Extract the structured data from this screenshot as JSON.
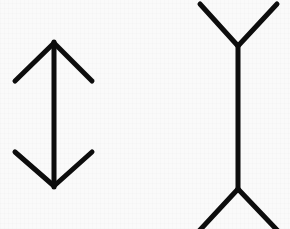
{
  "image": {
    "title": "Müller-Lyer illusion",
    "description": "Two vertical line segments of equal length; the left is capped with inward-pointing arrowheads, the right with outward-pointing fins.",
    "width": 290,
    "height": 229,
    "background_color": "#fafafa",
    "stroke_color": "#0d0d0d",
    "stroke_width": 5,
    "line_cap": "round",
    "figure_count": 2
  },
  "figures": [
    {
      "id": "left",
      "name": "arrow-in-figure",
      "label": "Inward arrowheads",
      "arrow_direction": "inward",
      "appears_as": "shorter",
      "shaft": {
        "x": 54,
        "y_top": 42,
        "y_bottom": 187,
        "length": 145
      },
      "top_cap": {
        "type": "arrowhead",
        "apex_x": 54,
        "apex_y": 42,
        "left_tip_x": 15,
        "left_tip_y": 81,
        "right_tip_x": 92,
        "right_tip_y": 81,
        "points": "down-out"
      },
      "bottom_cap": {
        "type": "arrowhead",
        "apex_x": 54,
        "apex_y": 187,
        "left_tip_x": 15,
        "left_tip_y": 152,
        "right_tip_x": 92,
        "right_tip_y": 152,
        "points": "up-out"
      }
    },
    {
      "id": "right",
      "name": "arrow-out-figure",
      "label": "Outward fins",
      "arrow_direction": "outward",
      "appears_as": "longer",
      "shaft": {
        "x": 238,
        "y_top": 45,
        "y_bottom": 190,
        "length": 145
      },
      "top_cap": {
        "type": "fin",
        "apex_x": 238,
        "apex_y": 45,
        "left_tip_x": 200,
        "left_tip_y": 4,
        "right_tip_x": 277,
        "right_tip_y": 4,
        "points": "up-out"
      },
      "bottom_cap": {
        "type": "fin",
        "apex_x": 238,
        "apex_y": 190,
        "left_tip_x": 199,
        "left_tip_y": 231,
        "right_tip_x": 278,
        "right_tip_y": 231,
        "points": "down-out",
        "clipped": "bottom edge"
      }
    }
  ]
}
